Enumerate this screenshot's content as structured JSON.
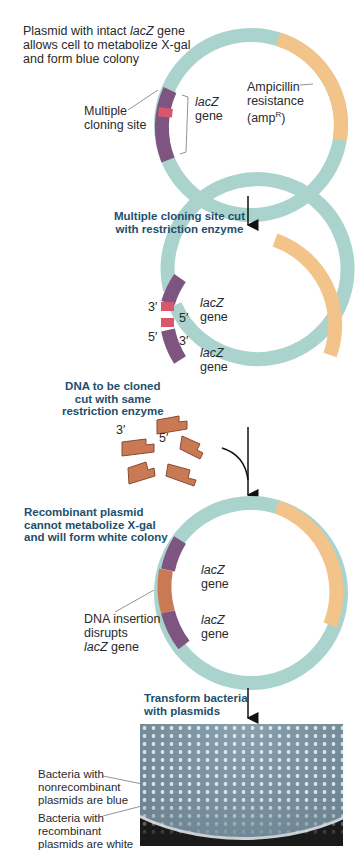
{
  "panel1": {
    "caption": [
      "Plasmid with intact ",
      "lacZ",
      " gene",
      "allows cell to metabolize X-gal",
      "and form blue colony"
    ],
    "mcs_label": [
      "Multiple",
      "cloning site"
    ],
    "lacz_label": [
      "lacZ",
      "gene"
    ],
    "amp_label": [
      "Ampicillin",
      "resistance",
      "(amp",
      "R",
      ")"
    ]
  },
  "step1": [
    "Multiple cloning site cut",
    "with restriction enzyme"
  ],
  "panel2": {
    "lacz_top": [
      "lacZ",
      "gene"
    ],
    "lacz_bottom": [
      "lacZ",
      "gene"
    ],
    "end_top_3": "3′",
    "end_top_5": "5′",
    "end_bot_5": "5′",
    "end_bot_3": "3′"
  },
  "step2": [
    "DNA to be cloned",
    "cut with same",
    "restriction enzyme"
  ],
  "fragments": {
    "end3": "3′",
    "end5": "5′"
  },
  "step3": [
    "Recombinant plasmid",
    "cannot metabolize X-gal",
    "and will form white colony"
  ],
  "panel3": {
    "lacz_top": [
      "lacZ",
      "gene"
    ],
    "lacz_bottom": [
      "lacZ",
      "gene"
    ],
    "insert_label": [
      "DNA insertion",
      "disrupts",
      "lacZ",
      " gene"
    ]
  },
  "step4": [
    "Transform bacteria",
    "with plasmids"
  ],
  "plate_labels": {
    "blue": [
      "Bacteria with",
      "nonrecombinant",
      "plasmids are blue"
    ],
    "white": [
      "Bacteria with",
      "recombinant",
      "plasmids are white"
    ]
  },
  "colors": {
    "plasmid": "#a9d3cc",
    "amp": "#f2c48a",
    "lacz": "#7d5580",
    "mcs": "#d9566b",
    "insert": "#c97a55",
    "step_text": "#1d4f6e"
  }
}
